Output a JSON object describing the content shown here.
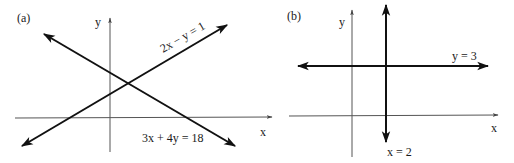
{
  "panels": [
    {
      "id": "a",
      "label": "(a)",
      "axes": {
        "x_label": "x",
        "y_label": "y"
      },
      "lines": [
        {
          "equation": "2x − y = 1",
          "description": "line with positive slope, arrows at both ends"
        },
        {
          "equation": "3x + 4y = 18",
          "description": "line with negative slope, arrows at both ends"
        }
      ],
      "note": "The two lines intersect in the first quadrant"
    },
    {
      "id": "b",
      "label": "(b)",
      "axes": {
        "x_label": "x",
        "y_label": "y"
      },
      "lines": [
        {
          "equation": "y = 3",
          "description": "horizontal line above x-axis, arrows at both ends"
        },
        {
          "equation": "x = 2",
          "description": "vertical line right of y-axis, arrows at both ends"
        }
      ],
      "note": "Horizontal and vertical lines intersect at (2, 3)"
    }
  ],
  "colors": {
    "line": "#111111",
    "axis": "#555555",
    "background": "#ffffff"
  }
}
